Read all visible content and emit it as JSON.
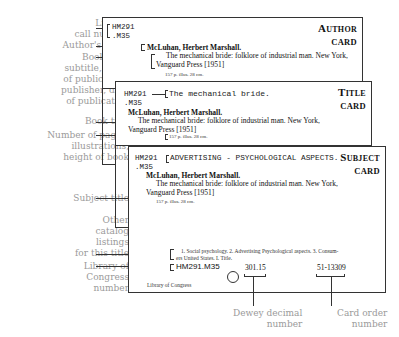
{
  "labels": {
    "call_number": "Library\ncall number",
    "author_name": "Author's name",
    "book_title_block": "Book title,\nsubtitle, place\nof publication,\npublisher, date\nof publication",
    "book_title": "Book title",
    "collation": "Number of pages,\nillustrations,\nheight of book",
    "subject_title": "Subject title",
    "other_listings": "Other\ncatalog\nlistings\nfor this title",
    "loc_number": "Library of\nCongress\nnumber",
    "dewey": "Dewey decimal\nnumber",
    "card_order": "Card order\nnumber"
  },
  "cards": {
    "author": {
      "type_line1": "Author",
      "type_line2": "card",
      "call_number_1": "HM291",
      "call_number_2": ".M35",
      "author": "McLuhan, Herbert Marshall.",
      "title_line": "The mechanical bride: folklore of industrial man.   New York,",
      "publisher_line": "Vanguard Press [1951]",
      "collation": "157 p.   illus.   28 cm."
    },
    "title": {
      "type_line1": "Title",
      "type_line2": "card",
      "call_number_1": "HM291",
      "call_number_2": ".M35",
      "heading": "The mechanical bride.",
      "author": "McLuhan, Herbert Marshall.",
      "title_line": "The mechanical bride: folklore of industrial man.   New York,",
      "publisher_line": "Vanguard Press [1951]",
      "collation": "157 p.   illus.   28 cm."
    },
    "subject": {
      "type_line1": "Subject",
      "type_line2": "card",
      "call_number_1": "HM291",
      "call_number_2": ".M35",
      "heading": "ADVERTISING - PSYCHOLOGICAL ASPECTS.",
      "author": "McLuhan, Herbert Marshall.",
      "title_line": "The mechanical bride: folklore of industrial man.   New York,",
      "publisher_line": "Vanguard Press [1951]",
      "collation": "157 p.   illus.   28 cm.",
      "tracings_1": "1. Social psychology.   2. Advertising   Psychological aspects.   3. Consum-",
      "tracings_2": "ers   United States.   I. Title.",
      "loc_number": "HM291.M35",
      "dewey": "301.15",
      "card_order": "51-13309",
      "library": "Library of Congress"
    }
  }
}
